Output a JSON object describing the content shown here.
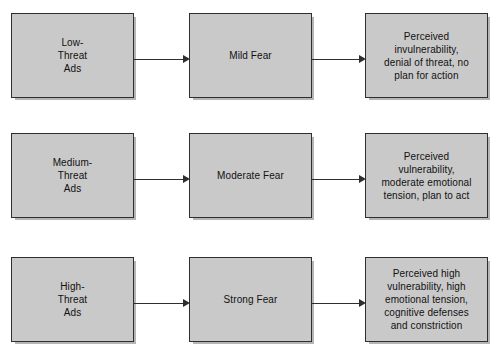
{
  "diagram": {
    "background_color": "#ffffff",
    "box_fill_color": "#c9c9c9",
    "box_border_color": "#2e2e2e",
    "arrow_color": "#2e2e2e",
    "columns": [
      "Stimulus",
      "Fear Level",
      "Outcome"
    ],
    "rows": [
      {
        "id": "low-threat",
        "stimulus": "Low-\nThreat\nAds",
        "fear": "Mild Fear",
        "outcome": "Perceived\ninvulnerability,\ndenial of threat, no\nplan for action"
      },
      {
        "id": "medium-threat",
        "stimulus": "Medium-\nThreat\nAds",
        "fear": "Moderate Fear",
        "outcome": "Perceived\nvulnerability,\nmoderate emotional\ntension, plan to act"
      },
      {
        "id": "high-threat",
        "stimulus": "High-\nThreat\nAds",
        "fear": "Strong Fear",
        "outcome": "Perceived high\nvulnerability, high\nemotional tension,\ncognitive defenses\nand constriction"
      }
    ]
  }
}
